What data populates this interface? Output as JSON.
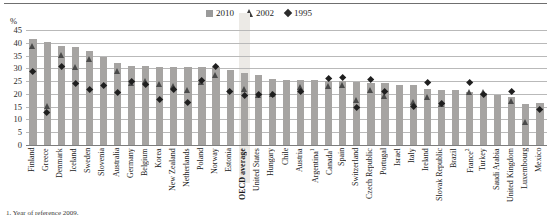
{
  "axis": {
    "unit_label": "%",
    "yticks": [
      0,
      5,
      10,
      15,
      20,
      25,
      30,
      35,
      40,
      45
    ],
    "ymin": 0,
    "ymax": 45
  },
  "legend": {
    "position": "top-center",
    "items": [
      {
        "label": "2010",
        "marker": "square-marker",
        "color": "#9a9a9a"
      },
      {
        "label": "2002",
        "marker": "triangle-marker",
        "color": "#3c3c3c"
      },
      {
        "label": "1995",
        "marker": "diamond-marker",
        "color": "#2b2b2b"
      }
    ]
  },
  "footnote": "1. Year of reference 2009.",
  "highlight_category": "OECD average",
  "chart_data": {
    "type": "bar",
    "title": "",
    "subtitle": "",
    "xlabel": "",
    "ylabel": "%",
    "ylim": [
      0,
      45
    ],
    "grid": true,
    "legend_position": "top-center",
    "categories": [
      "Finland",
      "Greece",
      "Denmark",
      "Iceland",
      "Sweden",
      "Slovenia",
      "Australia",
      "Germany",
      "Belgium",
      "Korea",
      "New Zealand",
      "Netherlands",
      "Poland",
      "Norway",
      "Estonia",
      "OECD average",
      "United States",
      "Hungary",
      "Chile",
      "Austria",
      "Argentina¹",
      "Canada¹",
      "Spain",
      "Switzerland",
      "Czech Republic",
      "Portugal",
      "Israel",
      "Italy",
      "Ireland",
      "Slovak Republic",
      "Brazil",
      "France²",
      "Turkey",
      "Saudi Arabia",
      "United Kingdom",
      "Luxembourg",
      "Mexico"
    ],
    "series": [
      {
        "name": "2010",
        "marker": "square",
        "values": [
          41.5,
          40.5,
          38.8,
          38.5,
          36.8,
          34.3,
          32.2,
          31.0,
          30.8,
          30.5,
          30.6,
          30.5,
          30.4,
          30.4,
          29.3,
          28.3,
          27.3,
          26.0,
          25.6,
          25.4,
          25.3,
          25.1,
          24.9,
          24.6,
          24.4,
          24.2,
          23.6,
          23.5,
          22.0,
          21.7,
          21.4,
          20.9,
          20.5,
          19.6,
          18.8,
          16.1,
          16.6
        ]
      },
      {
        "name": "2002",
        "marker": "triangle",
        "values": [
          38.5,
          15.0,
          35.0,
          30.3,
          33.5,
          null,
          28.8,
          24.0,
          24.8,
          23.8,
          23.0,
          21.5,
          24.5,
          27.3,
          null,
          21.9,
          19.6,
          20.0,
          null,
          22.5,
          null,
          22.9,
          23.3,
          17.5,
          21.5,
          19.2,
          null,
          16.8,
          18.9,
          15.8,
          null,
          20.7,
          20.5,
          null,
          17.3,
          9.0,
          null
        ]
      },
      {
        "name": "1995",
        "marker": "diamond",
        "values": [
          28.5,
          12.8,
          30.5,
          24.1,
          21.8,
          23.3,
          20.6,
          24.9,
          23.5,
          17.8,
          21.6,
          16.4,
          25.3,
          30.6,
          20.9,
          19.2,
          19.7,
          19.6,
          null,
          20.8,
          null,
          26.0,
          26.2,
          14.7,
          25.4,
          21.0,
          null,
          14.9,
          24.2,
          16.0,
          null,
          24.4,
          19.8,
          null,
          20.8,
          null,
          14.0
        ]
      }
    ]
  }
}
